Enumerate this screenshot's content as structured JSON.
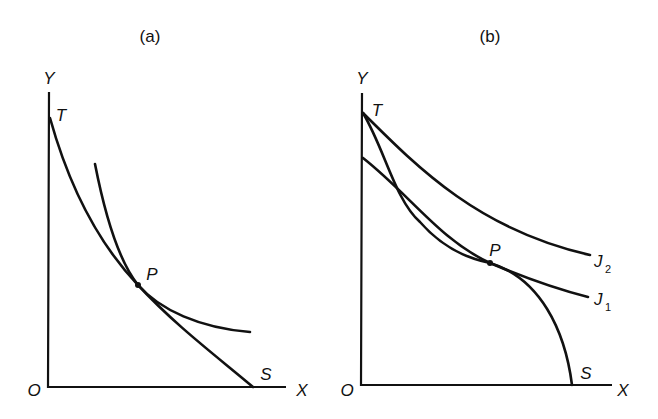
{
  "panels": [
    {
      "id": "a",
      "title": "(a)",
      "axis_labels": {
        "y": "Y",
        "x": "X",
        "origin": "O"
      },
      "curve_labels": {
        "T": "T",
        "S": "S",
        "P": "P"
      },
      "curves": [
        {
          "name": "transformation-curve",
          "from": "T",
          "to": "S",
          "shape": "concave-to-origin-convex"
        },
        {
          "name": "indifference-curve",
          "tangent_at": "P"
        }
      ]
    },
    {
      "id": "b",
      "title": "(b)",
      "axis_labels": {
        "y": "Y",
        "x": "X",
        "origin": "O"
      },
      "curve_labels": {
        "T": "T",
        "S": "S",
        "P": "P",
        "J1": "J",
        "J1_sub": "1",
        "J2": "J",
        "J2_sub": "2"
      },
      "curves": [
        {
          "name": "transformation-curve",
          "from": "T",
          "to": "S",
          "shape": "S-shaped"
        },
        {
          "name": "indifference-curve-J1",
          "label": "J1",
          "tangent_at": "P"
        },
        {
          "name": "indifference-curve-J2",
          "label": "J2",
          "through": "T"
        }
      ]
    }
  ]
}
